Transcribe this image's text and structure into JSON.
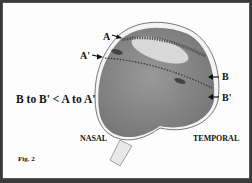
{
  "figure": {
    "label": "Fig. 2",
    "markers": {
      "A": "A",
      "A_prime": "A'",
      "B": "B",
      "B_prime": "B'"
    },
    "equation": "B to B' < A to A'",
    "orientation": {
      "left": "NASAL",
      "right": "TEMPORAL"
    },
    "colors": {
      "background": "#fdfdfd",
      "eye_fill": "#8a8a8a",
      "border": "#3a3a3a"
    }
  }
}
